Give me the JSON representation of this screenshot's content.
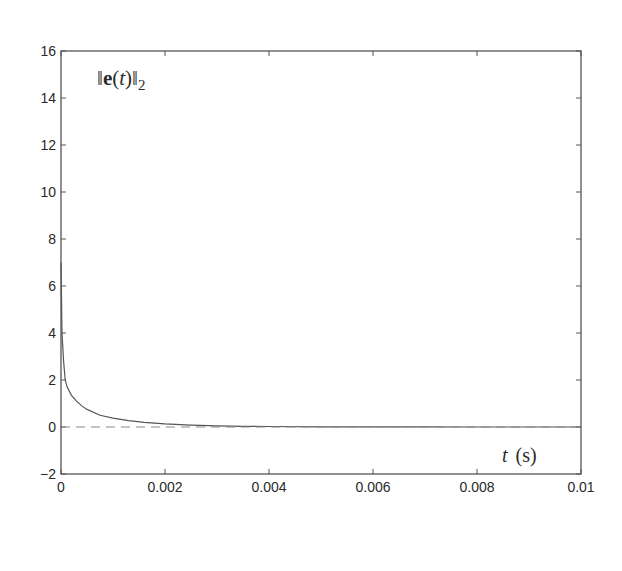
{
  "chart_data": {
    "type": "line",
    "title": "",
    "annotation": "||e(t)||_2",
    "annotation_parts": {
      "bar": "‖",
      "bold": "e",
      "open": "(",
      "var": "t",
      "close": ")",
      "sub": "2"
    },
    "xlabel": "t (s)",
    "xlabel_parts": {
      "var": "t",
      "unit": "(s)"
    },
    "ylabel": "",
    "xlim": [
      0,
      0.01
    ],
    "ylim": [
      -2,
      16
    ],
    "xticks": [
      0,
      0.002,
      0.004,
      0.006,
      0.008,
      0.01
    ],
    "xtick_labels": [
      "0",
      "0.002",
      "0.004",
      "0.006",
      "0.008",
      "0.01"
    ],
    "yticks": [
      -2,
      0,
      2,
      4,
      6,
      8,
      10,
      12,
      14,
      16
    ],
    "ytick_labels": [
      "−2",
      "0",
      "2",
      "4",
      "6",
      "8",
      "10",
      "12",
      "14",
      "16"
    ],
    "grid": false,
    "legend": null,
    "series": [
      {
        "name": "||e(t)||_2",
        "style": "solid",
        "color": "#555555",
        "x": [
          0,
          2e-05,
          5e-05,
          8e-05,
          0.00012,
          0.0002,
          0.0003,
          0.0004,
          0.0005,
          0.00075,
          0.001,
          0.0013,
          0.0016,
          0.002,
          0.0025,
          0.003,
          0.0035,
          0.004,
          0.005,
          0.006,
          0.007,
          0.008,
          0.009,
          0.01
        ],
        "values": [
          7.0,
          4.0,
          2.8,
          2.0,
          1.7,
          1.35,
          1.1,
          0.9,
          0.75,
          0.5,
          0.38,
          0.27,
          0.2,
          0.13,
          0.08,
          0.05,
          0.03,
          0.02,
          0.01,
          0.005,
          0.003,
          0.002,
          0.001,
          0.001
        ]
      },
      {
        "name": "zero reference",
        "style": "dashed",
        "color": "#8a8a8a",
        "x": [
          0,
          0.01
        ],
        "values": [
          0,
          0
        ]
      }
    ]
  }
}
